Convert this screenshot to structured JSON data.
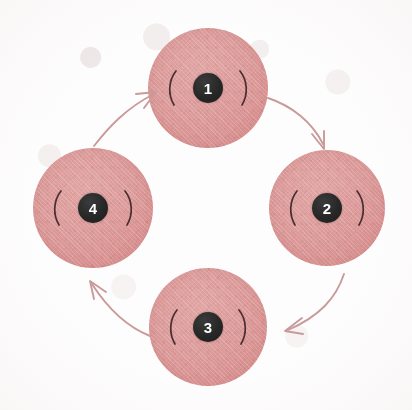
{
  "diagram": {
    "background_color": "#fefdfd",
    "node_fill_color": "#dd9b9a",
    "badge_color": "#272727",
    "badge_text_color": "#ffffff",
    "arrow_color": "#c99a99",
    "paren_color": "#4a2f30",
    "direction": "clockwise",
    "nodes": [
      {
        "id": "node-1",
        "label": "1",
        "position": "top",
        "cx": 208,
        "cy": 88,
        "r": 60,
        "left_mark": "(",
        "right_mark": ")"
      },
      {
        "id": "node-2",
        "label": "2",
        "position": "right",
        "cx": 327,
        "cy": 208,
        "r": 58,
        "left_mark": "(",
        "right_mark": ")"
      },
      {
        "id": "node-3",
        "label": "3",
        "position": "bottom",
        "cx": 208,
        "cy": 327,
        "r": 59,
        "left_mark": "(",
        "right_mark": ")"
      },
      {
        "id": "node-4",
        "label": "4",
        "position": "left",
        "cx": 93,
        "cy": 208,
        "r": 60,
        "left_mark": "(",
        "right_mark": ")"
      }
    ],
    "arrows": [
      {
        "id": "arrow-1-to-2",
        "from": "node-1",
        "to": "node-2",
        "points_toward": "down-right"
      },
      {
        "id": "arrow-2-to-3",
        "from": "node-2",
        "to": "node-3",
        "points_toward": "down-left"
      },
      {
        "id": "arrow-3-to-4",
        "from": "node-3",
        "to": "node-4",
        "points_toward": "up-left"
      },
      {
        "id": "arrow-4-to-1",
        "from": "node-4",
        "to": "node-1",
        "points_toward": "up-right"
      }
    ]
  }
}
